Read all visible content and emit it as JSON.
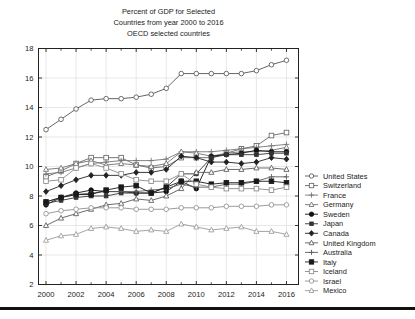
{
  "chart_data": {
    "type": "line",
    "title_lines": [
      "Percent of GDP for Selected",
      "Countries from year 2000 to 2016",
      "OECD selected countries"
    ],
    "xlabel": "",
    "ylabel": "",
    "xlim": [
      1999.5,
      2016.8
    ],
    "ylim": [
      2,
      18
    ],
    "yticks": [
      2,
      4,
      6,
      8,
      10,
      12,
      14,
      16,
      18
    ],
    "xticks": [
      2000,
      2002,
      2004,
      2006,
      2008,
      2010,
      2012,
      2014,
      2016
    ],
    "xticks_minor": [
      2001,
      2003,
      2005,
      2007,
      2009,
      2011,
      2013,
      2015
    ],
    "grid": true,
    "legend_position": "right",
    "x": [
      2000,
      2001,
      2002,
      2003,
      2004,
      2005,
      2006,
      2007,
      2008,
      2009,
      2010,
      2011,
      2012,
      2013,
      2014,
      2015,
      2016
    ],
    "series": [
      {
        "name": "United States",
        "marker": "circle-open",
        "color": "#555555",
        "values": [
          12.5,
          13.2,
          13.9,
          14.5,
          14.6,
          14.6,
          14.7,
          14.9,
          15.3,
          16.3,
          16.3,
          16.3,
          16.3,
          16.3,
          16.5,
          16.9,
          17.2
        ]
      },
      {
        "name": "Switzerland",
        "marker": "square-open",
        "color": "#666666",
        "values": [
          9.3,
          9.7,
          10.2,
          10.6,
          10.6,
          10.6,
          10.1,
          9.9,
          10.0,
          10.6,
          10.6,
          10.6,
          10.9,
          11.2,
          11.4,
          12.1,
          12.3
        ]
      },
      {
        "name": "France",
        "marker": "plus",
        "color": "#777777",
        "values": [
          9.5,
          9.6,
          9.9,
          10.2,
          10.3,
          10.4,
          10.4,
          10.4,
          10.5,
          11.0,
          11.0,
          11.0,
          11.1,
          11.2,
          11.3,
          11.4,
          11.5
        ]
      },
      {
        "name": "Germany",
        "marker": "triangle",
        "color": "#707070",
        "values": [
          9.8,
          9.9,
          10.2,
          10.4,
          10.1,
          10.2,
          10.1,
          10.0,
          10.2,
          11.0,
          10.9,
          10.7,
          10.9,
          11.0,
          11.0,
          11.1,
          11.3
        ]
      },
      {
        "name": "Sweden",
        "marker": "circle-filled",
        "color": "#111111",
        "values": [
          7.4,
          7.9,
          8.2,
          8.4,
          8.3,
          8.3,
          8.2,
          8.2,
          8.3,
          9.0,
          8.5,
          10.7,
          10.8,
          10.9,
          11.1,
          11.0,
          11.0
        ]
      },
      {
        "name": "Japan",
        "marker": "square-filled-small",
        "color": "#333333",
        "values": [
          7.5,
          7.7,
          7.9,
          8.0,
          8.0,
          8.2,
          8.2,
          8.2,
          8.6,
          9.5,
          9.5,
          10.6,
          10.8,
          10.8,
          10.8,
          10.9,
          10.9
        ]
      },
      {
        "name": "Canada",
        "marker": "diamond-filled",
        "color": "#222222",
        "values": [
          8.3,
          8.7,
          9.1,
          9.4,
          9.4,
          9.4,
          9.6,
          9.6,
          9.8,
          10.7,
          10.6,
          10.3,
          10.3,
          10.2,
          10.3,
          10.6,
          10.5
        ]
      },
      {
        "name": "United Kingdom",
        "marker": "triangle",
        "color": "#5a5a5a",
        "values": [
          6.0,
          6.5,
          6.8,
          7.1,
          7.4,
          7.5,
          7.8,
          7.7,
          8.0,
          8.5,
          9.6,
          9.6,
          9.8,
          9.8,
          9.9,
          9.9,
          9.8
        ]
      },
      {
        "name": "Australia",
        "marker": "plus",
        "color": "#5c5c5c",
        "values": [
          7.6,
          7.9,
          8.1,
          8.2,
          8.3,
          8.3,
          8.3,
          8.4,
          8.5,
          8.8,
          8.6,
          8.6,
          8.8,
          8.8,
          9.0,
          9.3,
          9.3
        ]
      },
      {
        "name": "Italy",
        "marker": "square-filled",
        "color": "#1a1a1a",
        "values": [
          7.6,
          7.9,
          8.1,
          8.1,
          8.4,
          8.6,
          8.7,
          8.2,
          8.6,
          9.0,
          9.0,
          8.8,
          8.9,
          8.9,
          9.0,
          9.0,
          8.9
        ]
      },
      {
        "name": "Iceland",
        "marker": "square-open",
        "color": "#8a8a8a",
        "values": [
          9.0,
          9.1,
          9.9,
          10.2,
          9.9,
          9.5,
          9.1,
          9.0,
          9.0,
          9.5,
          8.8,
          8.6,
          8.5,
          8.5,
          8.5,
          8.4,
          8.6
        ]
      },
      {
        "name": "Israel",
        "marker": "circle-open",
        "color": "#909090",
        "values": [
          6.8,
          7.0,
          7.1,
          7.2,
          7.2,
          7.2,
          7.1,
          7.1,
          7.1,
          7.2,
          7.2,
          7.2,
          7.3,
          7.3,
          7.3,
          7.4,
          7.4
        ]
      },
      {
        "name": "Mexico",
        "marker": "triangle",
        "color": "#999999",
        "values": [
          5.0,
          5.3,
          5.4,
          5.8,
          5.9,
          5.8,
          5.6,
          5.7,
          5.6,
          6.1,
          5.9,
          5.7,
          5.8,
          5.9,
          5.6,
          5.6,
          5.4
        ]
      }
    ]
  }
}
